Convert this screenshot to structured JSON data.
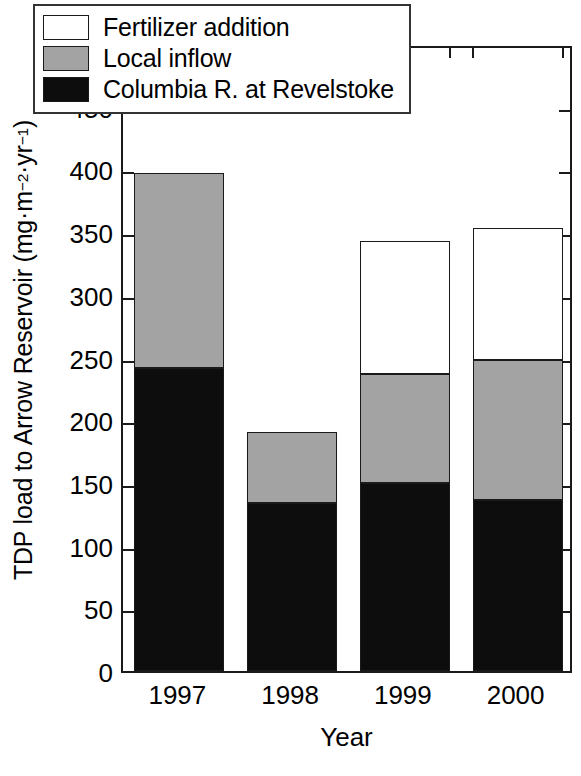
{
  "chart_data": {
    "type": "bar",
    "subtype": "stacked-bar",
    "title": "",
    "xlabel": "Year",
    "ylabel": "TDP load to Arrow Reservoir (mg·m⁻²·yr⁻¹)",
    "ylabel_parts": {
      "prefix": "TDP load to Arrow Reservoir (mg·m",
      "sup1": "−2",
      "mid": "·yr",
      "sup2": "−1",
      "suffix": ")"
    },
    "categories": [
      "1997",
      "1998",
      "1999",
      "2000"
    ],
    "series": [
      {
        "name": "Columbia R. at Revelstoke",
        "color": "#0d0d0d",
        "values": [
          242,
          134,
          150,
          136
        ]
      },
      {
        "name": "Local inflow",
        "color": "#a3a3a3",
        "values": [
          155,
          57,
          87,
          112
        ]
      },
      {
        "name": "Fertilizer addition",
        "color": "#ffffff",
        "values": [
          0,
          0,
          106,
          105
        ]
      }
    ],
    "totals": [
      397,
      191,
      343,
      353
    ],
    "ylim": [
      0,
      500
    ],
    "ytick_values": [
      0,
      50,
      100,
      150,
      200,
      250,
      300,
      350,
      400,
      450,
      500
    ],
    "ytick_labels": [
      "0",
      "50",
      "100",
      "150",
      "200",
      "250",
      "300",
      "350",
      "400",
      "450",
      "500"
    ],
    "grid": false,
    "legend_position": "upper-left-inside",
    "legend_entries": [
      {
        "label": "Fertilizer addition",
        "color": "#ffffff"
      },
      {
        "label": "Local inflow",
        "color": "#a3a3a3"
      },
      {
        "label": "Columbia R. at Revelstoke",
        "color": "#0d0d0d"
      }
    ],
    "axis_color": "#1a1a1a",
    "background": "#ffffff"
  }
}
